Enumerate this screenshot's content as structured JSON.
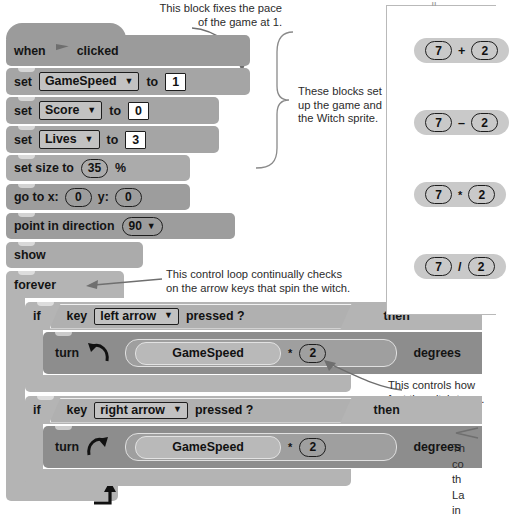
{
  "annotations": {
    "pace": "This block fixes the pace\nof the game at 1.",
    "setup": "These blocks set\nup the game and\nthe Witch sprite.",
    "loop": "This control loop continually checks\non the arrow keys that spin the witch.",
    "speed": "This controls how\nfast the witch turns.",
    "bottom_right_cut": "Th\nco\nth\nLa\nin"
  },
  "script": {
    "hat": {
      "when": "when",
      "clicked": "clicked",
      "icon": "green-flag-icon"
    },
    "blocks": [
      {
        "id": "set-gamespeed",
        "kind": "set",
        "label": "set",
        "variable": "GameSpeed",
        "caret": "▼",
        "to": "to",
        "value": "1"
      },
      {
        "id": "set-score",
        "kind": "set",
        "label": "set",
        "variable": "Score",
        "caret": "▼",
        "to": "to",
        "value": "0"
      },
      {
        "id": "set-lives",
        "kind": "set",
        "label": "set",
        "variable": "Lives",
        "caret": "▼",
        "to": "to",
        "value": "3"
      },
      {
        "id": "set-size",
        "kind": "size",
        "prefix": "set size to",
        "value": "35",
        "suffix": "%"
      },
      {
        "id": "go-to-xy",
        "kind": "goto",
        "prefix": "go to x:",
        "x": "0",
        "mid": "y:",
        "y": "0"
      },
      {
        "id": "point-dir",
        "kind": "point",
        "prefix": "point in direction",
        "value": "90",
        "caret": "▼"
      },
      {
        "id": "show",
        "kind": "simple",
        "label": "show"
      }
    ],
    "forever": {
      "label": "forever"
    },
    "if_left": {
      "if": "if",
      "key_label": "key",
      "key_value": "left arrow",
      "caret": "▼",
      "pressed": "pressed ?",
      "then": "then",
      "turn": "turn",
      "direction_icon": "turn-counterclockwise-icon",
      "operand_a": "GameSpeed",
      "operator": "*",
      "operand_b": "2",
      "degrees": "degrees"
    },
    "if_right": {
      "if": "if",
      "key_label": "key",
      "key_value": "right arrow",
      "caret": "▼",
      "pressed": "pressed ?",
      "then": "then",
      "turn": "turn",
      "direction_icon": "turn-clockwise-icon",
      "operand_a": "GameSpeed",
      "operator": "*",
      "operand_b": "2",
      "degrees": "degrees"
    }
  },
  "math_panel": {
    "rows": [
      {
        "a": "7",
        "op": "+",
        "b": "2"
      },
      {
        "a": "7",
        "op": "–",
        "b": "2"
      },
      {
        "a": "7",
        "op": "*",
        "b": "2"
      },
      {
        "a": "7",
        "op": "/",
        "b": "2"
      }
    ]
  },
  "colors": {
    "page_bg": "#ffffff",
    "block_vars": "#a5a5a5",
    "block_looks": "#ababab",
    "block_motion": "#9d9d9d",
    "block_control": "#b4b4b4",
    "block_turn": "#8d8d8d",
    "math_block": "#c9c9c9",
    "text": "#231f20",
    "outline": "#1d1d1d"
  }
}
